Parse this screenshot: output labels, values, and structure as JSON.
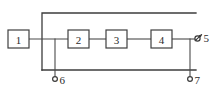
{
  "diagram": {
    "type": "block-diagram",
    "background_color": "#ffffff",
    "line_color": "#3f3f3f",
    "text_color": "#2b2b2b",
    "blocks": [
      {
        "id": "block-1",
        "label": "1",
        "x": 8,
        "y": 30,
        "w": 21,
        "h": 18
      },
      {
        "id": "block-2",
        "label": "2",
        "x": 68,
        "y": 30,
        "w": 21,
        "h": 18
      },
      {
        "id": "block-3",
        "label": "3",
        "x": 106,
        "y": 30,
        "w": 21,
        "h": 18
      },
      {
        "id": "block-4",
        "label": "4",
        "x": 151,
        "y": 30,
        "w": 21,
        "h": 18
      }
    ],
    "terminals": [
      {
        "id": "terminal-5",
        "label": "5",
        "symbol": "arrow-slash-marker",
        "x": 197,
        "y": 37,
        "label_x": 205,
        "label_y": 37
      },
      {
        "id": "terminal-6",
        "label": "6",
        "symbol": "open-circle",
        "x": 55,
        "y": 79,
        "label_x": 61,
        "label_y": 80
      },
      {
        "id": "terminal-7",
        "label": "7",
        "symbol": "open-circle",
        "x": 190,
        "y": 79,
        "label_x": 196,
        "label_y": 80
      }
    ],
    "rails": {
      "top_label": "top-feedback-rail",
      "bottom_label": "bottom-return-rail",
      "top_y": 13,
      "bottom_y": 70,
      "left_x": 42,
      "right_x": 196
    },
    "signal_line_y": 39
  }
}
